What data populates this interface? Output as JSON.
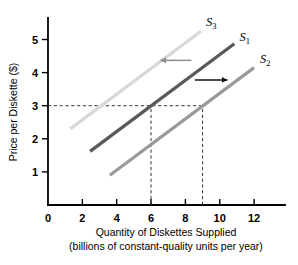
{
  "chart_data": {
    "type": "line",
    "title": "",
    "xlabel": "Quantity of Diskettes Supplied",
    "xlabel_line2": "(billions of constant-quality units per year)",
    "ylabel": "Price per Diskette ($)",
    "xlim": [
      0,
      13.8
    ],
    "ylim": [
      0,
      5.65
    ],
    "xticks": [
      0,
      2,
      4,
      6,
      8,
      10,
      12
    ],
    "xtick_labels": [
      "0",
      "2",
      "4",
      "6",
      "8",
      "10",
      "12"
    ],
    "yticks": [
      1,
      2,
      3,
      4,
      5
    ],
    "ytick_labels": [
      "1",
      "2",
      "3",
      "4",
      "5"
    ],
    "grid": false,
    "legend_position": "inline-curve-labels",
    "series": [
      {
        "name": "S1",
        "label_text": "S",
        "label_sub": "1",
        "color": "#595959",
        "x": [
          2.45,
          10.85
        ],
        "y": [
          1.62,
          4.87
        ],
        "label_x": 11.15,
        "label_y": 4.95
      },
      {
        "name": "S2",
        "label_text": "S",
        "label_sub": "2",
        "color": "#9a9a9a",
        "x": [
          3.6,
          12.0
        ],
        "y": [
          0.9,
          4.15
        ],
        "label_x": 12.35,
        "label_y": 4.28
      },
      {
        "name": "S3",
        "label_text": "S",
        "label_sub": "3",
        "color": "#d8d8d8",
        "x": [
          1.3,
          8.9
        ],
        "y": [
          2.3,
          5.25
        ],
        "label_x": 9.2,
        "label_y": 5.4
      }
    ],
    "reference_lines": [
      {
        "name": "price-3-horizontal",
        "type": "horizontal",
        "value": 3,
        "x_from": 0,
        "x_to": 9
      },
      {
        "name": "quantity-6-vertical",
        "type": "vertical",
        "value": 6,
        "y_from": 0,
        "y_to": 3
      },
      {
        "name": "quantity-9-vertical",
        "type": "vertical",
        "value": 9,
        "y_from": 0,
        "y_to": 3
      }
    ],
    "annotations": [
      {
        "name": "shift-left-arrow",
        "direction": "left",
        "color": "#8c8c8c",
        "x_from": 8.35,
        "x_to": 6.55,
        "y": 4.37
      },
      {
        "name": "shift-right-arrow",
        "direction": "right",
        "color": "#111111",
        "x_from": 8.55,
        "x_to": 10.45,
        "y": 3.78
      }
    ]
  },
  "axis": {
    "y_title": "Price per Diskette ($)",
    "x_title_line1": "Quantity of Diskettes Supplied",
    "x_title_line2": "(billions of constant-quality units per year)"
  }
}
